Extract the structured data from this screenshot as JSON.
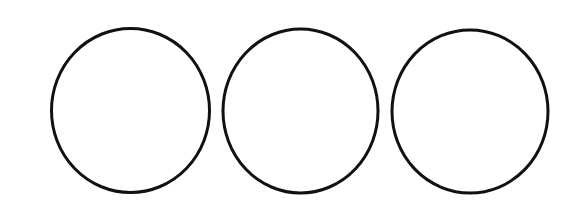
{
  "diagram": {
    "background": "#ffffff",
    "stroke_color": "#111111",
    "stroke_width": 3,
    "fill": "none",
    "shapes": [
      {
        "type": "ellipse",
        "cx": 130.5,
        "cy": 110.5,
        "rx": 79,
        "ry": 82
      },
      {
        "type": "ellipse",
        "cx": 300.5,
        "cy": 111,
        "rx": 77.5,
        "ry": 82
      },
      {
        "type": "ellipse",
        "cx": 470,
        "cy": 111.5,
        "rx": 78,
        "ry": 81.5
      }
    ]
  }
}
